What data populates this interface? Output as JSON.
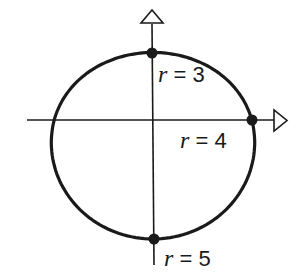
{
  "diagram": {
    "title": "",
    "curve": {
      "type": "polar",
      "equation": "r = 4 - sin(theta)",
      "color": "#1a1a1a"
    },
    "points": [
      {
        "id": "top",
        "r_label": "r",
        "eq": "=",
        "value": "3",
        "text": "r = 3"
      },
      {
        "id": "right",
        "r_label": "r",
        "eq": "=",
        "value": "4",
        "text": "r = 4"
      },
      {
        "id": "bottom",
        "r_label": "r",
        "eq": "=",
        "value": "5",
        "text": "r = 5"
      }
    ],
    "axes": {
      "horizontal": {
        "arrow": "open-triangle-right"
      },
      "vertical": {
        "arrow": "open-triangle-up"
      }
    }
  }
}
